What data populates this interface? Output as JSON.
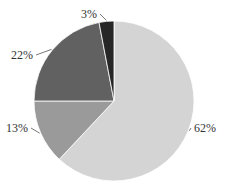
{
  "chart_data": {
    "type": "pie",
    "title": "",
    "labels": [
      "62%",
      "13%",
      "22%",
      "3%"
    ],
    "values": [
      62,
      13,
      22,
      3
    ],
    "colors": [
      "#d4d4d4",
      "#9a9a9a",
      "#616161",
      "#262626"
    ],
    "start_angle_deg": 0,
    "direction": "clockwise",
    "legend": "none",
    "slice_border_color": "#ffffff"
  }
}
